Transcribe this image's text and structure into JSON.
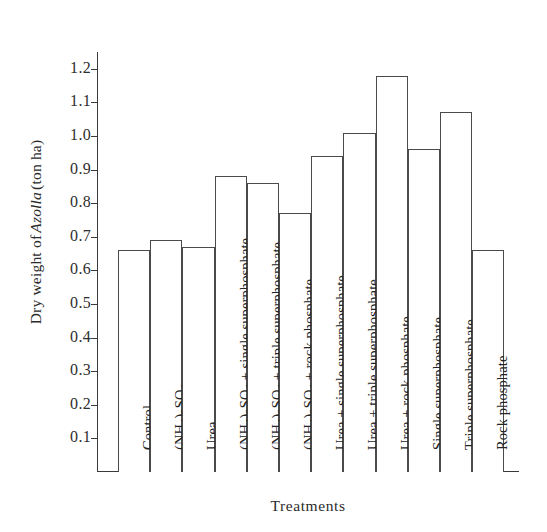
{
  "chart_data": {
    "type": "bar",
    "title": "",
    "xlabel": "Treatments",
    "ylabel_plain": "Dry weight of Azolla (ton ha)",
    "ylabel_prefix": "Dry weight of ",
    "ylabel_italic": "Azolla",
    "ylabel_suffix": " (ton ha)",
    "ylim": [
      0,
      1.25
    ],
    "ytick_values": [
      0.1,
      0.2,
      0.3,
      0.4,
      0.5,
      0.6,
      0.7,
      0.8,
      0.9,
      1.0,
      1.1,
      1.2
    ],
    "ytick_labels": [
      "0.1",
      "0.2",
      "0.3",
      "0.4",
      "0.5",
      "0.6",
      "0.7",
      "0.8",
      "0.9",
      "1.0",
      "1.1",
      "1.2"
    ],
    "grid": false,
    "legend": "none",
    "bar_color": "#ffffff",
    "bar_edge_color": "#4a4a4a",
    "axis_color": "#3a3a3a",
    "categories": [
      "Control",
      "(NH4)2SO4",
      "Urea",
      "(NH4)2SO4 + single superphosphate",
      "(NH4)2SO4 + triple superphosphate",
      "(NH4)2SO4 + rock phosphate",
      "Urea + single superphosphate",
      "Urea + triple superphosphate",
      "Urea + rock phosphate",
      "Single superphosphate",
      "Triple superphosphate",
      "Rock phosphate"
    ],
    "categories_html": [
      "Control",
      "(NH<sub>4</sub>)<sub>2</sub>SO<sub>4</sub>",
      "Urea",
      "(NH<sub>4</sub>)<sub>2</sub>SO<sub>4</sub> + single superphosphate",
      "(NH<sub>4</sub>)<sub>2</sub>SO<sub>4</sub> + triple superphosphate",
      "(NH<sub>4</sub>)<sub>2</sub>SO<sub>4</sub> + rock phosphate",
      "Urea + single superphosphate",
      "Urea + triple superphosphate",
      "Urea + rock phosphate",
      "Single superphosphate",
      "Triple superphosphate",
      "Rock phosphate"
    ],
    "values": [
      0.66,
      0.69,
      0.67,
      0.88,
      0.86,
      0.77,
      0.94,
      1.01,
      1.18,
      0.96,
      1.07,
      0.66
    ]
  }
}
